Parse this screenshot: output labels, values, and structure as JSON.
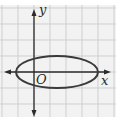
{
  "figure": {
    "type": "coordinate-graph",
    "labels": {
      "x_axis": "x",
      "y_axis": "y",
      "origin": "O"
    },
    "grid": {
      "visible": true,
      "spacing_px": 16,
      "color": "#cfcfcf",
      "background": "#f2f2f2"
    },
    "axes_color": "#2b2b2b",
    "curve": {
      "shape": "ellipse",
      "color": "#3a3a3a",
      "center_units": [
        1.5,
        0
      ],
      "semi_axis_x_units": 2.5,
      "semi_axis_y_units": 1
    }
  }
}
